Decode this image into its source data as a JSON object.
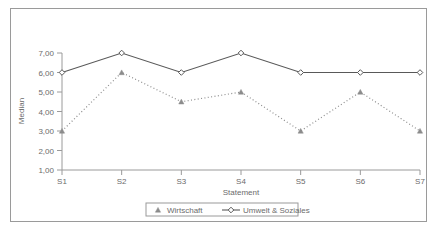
{
  "chart_data": {
    "type": "line",
    "title": "",
    "xlabel": "Statement",
    "ylabel": "Median",
    "categories": [
      "S1",
      "S2",
      "S3",
      "S4",
      "S5",
      "S6",
      "S7"
    ],
    "ylim": [
      1,
      7
    ],
    "ytick_labels": [
      "1,00",
      "2,00",
      "3,00",
      "4,00",
      "5,00",
      "6,00",
      "7,00"
    ],
    "ytick_values": [
      1,
      2,
      3,
      4,
      5,
      6,
      7
    ],
    "grid": false,
    "legend_position": "bottom",
    "series": [
      {
        "name": "Wirtschaft",
        "values": [
          3,
          6,
          4.5,
          5,
          3,
          5,
          3
        ],
        "line_style": "dotted",
        "marker": "triangle",
        "color": "#8c8c8c"
      },
      {
        "name": "Umwelt & Soziales",
        "values": [
          6,
          7,
          6,
          7,
          6,
          6,
          6
        ],
        "line_style": "solid",
        "marker": "diamond",
        "color": "#595959"
      }
    ]
  },
  "legend": {
    "entries": [
      {
        "label": "Wirtschaft",
        "marker": "triangle-marker"
      },
      {
        "label": "Umwelt & Soziales",
        "marker": "diamond-line-marker"
      }
    ]
  },
  "colors": {
    "frame": "#9a9a9a",
    "axis": "#9a9a9a",
    "series_solid": "#595959",
    "series_dotted": "#8c8c8c",
    "text": "#6b6b6b",
    "background": "#ffffff"
  }
}
